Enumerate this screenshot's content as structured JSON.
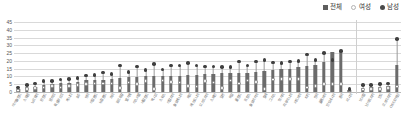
{
  "legend": {
    "position": "top-right",
    "items": [
      {
        "label": "전체",
        "marker": "bar-swatch-icon",
        "color": "#5e5e5e"
      },
      {
        "label": "여성",
        "marker": "open-circle-icon",
        "color": "#b2b2b2"
      },
      {
        "label": "남성",
        "marker": "filled-circle-icon",
        "color": "#4a4a4a"
      }
    ]
  },
  "colors": {
    "bar": "#6b6b6b",
    "female": "#fbfbfb",
    "female_stroke": "#8d8d8d",
    "male": "#3f3f3f",
    "grid": "#d9d9d9",
    "axis": "#b9b9b9",
    "text": "#555555"
  },
  "chart_data": {
    "type": "bar",
    "title": "",
    "subtitle": "",
    "xlabel": "",
    "ylabel": "",
    "ylim": [
      0,
      45
    ],
    "yticks": [
      0,
      5,
      10,
      15,
      20,
      25,
      30,
      35,
      40,
      45
    ],
    "grid": true,
    "legend_position": "top-right",
    "note": "Ordered ascending by 전체 (total). Final five categories are separated by a divider.",
    "divider_after_index": 39,
    "categories": [
      "아이슬란드",
      "스웨덴",
      "노르웨이",
      "핀란드",
      "덴마크",
      "룩셈부르크",
      "캐나다",
      "호주",
      "영국",
      "아일랜드",
      "뉴질랜드",
      "미국",
      "포르투갈",
      "벨기에",
      "이스라엘",
      "네덜란드",
      "멕시코",
      "스위스",
      "이탈리아",
      "슬로베니아",
      "체코",
      "에스토니아",
      "오스트리아",
      "스페인",
      "일본",
      "독일",
      "폴란드",
      "프랑스",
      "슬로바키아",
      "칠레",
      "그리스",
      "헝가리",
      "리투아니아",
      "라트비아",
      "터키",
      "한국",
      "콜롬비아",
      "인도네시아",
      "중국",
      "러시아",
      "브라질",
      "남아프리카",
      "인도",
      "코스타리카",
      "OECD평균"
    ],
    "series": [
      {
        "name": "전체",
        "type": "bar",
        "values": [
          2.0,
          3.0,
          3.5,
          4.5,
          5.0,
          5.5,
          6.0,
          6.5,
          7.5,
          8.0,
          8.0,
          8.5,
          9.0,
          9.5,
          9.5,
          10.0,
          10.0,
          10.5,
          10.5,
          10.5,
          11.0,
          11.0,
          11.5,
          11.5,
          12.0,
          12.0,
          12.5,
          12.5,
          13.0,
          13.5,
          14.0,
          14.5,
          15.0,
          16.0,
          17.0,
          17.5,
          19.0,
          25.5,
          25.5,
          1.5,
          2.5,
          3.0,
          3.5,
          4.0,
          17.5
        ]
      },
      {
        "name": "여성",
        "type": "scatter",
        "values": [
          1.0,
          2.0,
          2.5,
          3.0,
          4.0,
          3.0,
          4.0,
          4.5,
          5.0,
          5.5,
          5.5,
          5.5,
          2.5,
          6.0,
          5.0,
          7.0,
          2.0,
          7.5,
          6.5,
          6.0,
          4.0,
          3.5,
          7.0,
          6.0,
          2.5,
          7.5,
          5.5,
          7.5,
          6.5,
          2.0,
          8.0,
          8.5,
          8.5,
          8.5,
          3.0,
          4.0,
          5.0,
          5.0,
          5.0,
          1.0,
          1.5,
          2.0,
          2.0,
          2.5,
          3.5
        ]
      },
      {
        "name": "남성",
        "type": "scatter",
        "values": [
          3.0,
          4.5,
          5.5,
          7.0,
          7.0,
          8.0,
          8.5,
          9.0,
          10.5,
          11.0,
          12.5,
          11.5,
          17.0,
          13.0,
          16.5,
          14.0,
          18.0,
          14.5,
          17.0,
          17.0,
          18.5,
          17.0,
          16.5,
          16.5,
          16.0,
          16.0,
          19.5,
          17.0,
          19.5,
          20.5,
          19.0,
          18.5,
          19.5,
          20.0,
          24.0,
          20.5,
          25.0,
          20.5,
          26.5,
          2.0,
          4.5,
          4.5,
          5.0,
          5.5,
          34.0
        ]
      }
    ]
  }
}
